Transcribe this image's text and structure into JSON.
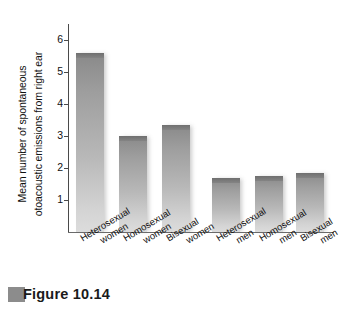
{
  "figure": {
    "caption_marker": "gray-square-marker",
    "caption_text": "Figure 10.14"
  },
  "chart_data": {
    "type": "bar",
    "title": "",
    "subtitle": "",
    "xlabel": "",
    "ylabel": "Mean number of spontaneous otoacoustic emissions from right ear",
    "ylabel_line1": "Mean number of spontaneous",
    "ylabel_line2": "otoacoustic emissions from right ear",
    "categories": [
      "Heterosexual women",
      "Homosexual women",
      "Bisexual women",
      "Heterosexual men",
      "Homosexual men",
      "Bisexual men"
    ],
    "categories_wrapped": [
      [
        "Heterosexual",
        "women"
      ],
      [
        "Homosexual",
        "women"
      ],
      [
        "Bisexual",
        "women"
      ],
      [
        "Heterosexual",
        "men"
      ],
      [
        "Homosexual",
        "men"
      ],
      [
        "Bisexual",
        "men"
      ]
    ],
    "values": [
      5.6,
      3.0,
      3.35,
      1.7,
      1.75,
      1.85
    ],
    "ylim": [
      0,
      6.5
    ],
    "yticks": [
      1,
      2,
      3,
      4,
      5,
      6
    ],
    "ytick_labels": [
      "1",
      "2",
      "3",
      "4",
      "5",
      "6"
    ],
    "grid": false,
    "legend": false,
    "legend_position": "none",
    "bar_color_top": "#7a7a7a",
    "bar_color_bottom": "#d8d8d8",
    "axis_color": "#4a4a4a"
  }
}
